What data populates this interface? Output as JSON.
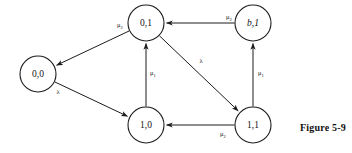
{
  "figure": {
    "caption": "Figure 5-9",
    "caption_x": 300,
    "caption_y": 122,
    "background_color": "#ffffff",
    "stroke_color": "#1c1c1c"
  },
  "diagram": {
    "type": "state-transition-diagram",
    "node_radius": 18,
    "nodes": [
      {
        "id": "n00",
        "label": "0,0",
        "x": 38,
        "y": 74,
        "italic": false
      },
      {
        "id": "n01",
        "label": "0,1",
        "x": 146,
        "y": 23,
        "italic": false
      },
      {
        "id": "nb1",
        "label": "b,1",
        "x": 253,
        "y": 23,
        "italic": true
      },
      {
        "id": "n10",
        "label": "1,0",
        "x": 146,
        "y": 125,
        "italic": false
      },
      {
        "id": "n11",
        "label": "1,1",
        "x": 253,
        "y": 125,
        "italic": false
      }
    ],
    "edges": [
      {
        "id": "e1",
        "from": "n01",
        "to": "n00",
        "label": "μ",
        "sub": "2",
        "label_x": 120,
        "label_y": 26
      },
      {
        "id": "e2",
        "from": "nb1",
        "to": "n01",
        "label": "μ",
        "sub": "2",
        "label_x": 229,
        "label_y": 18
      },
      {
        "id": "e3",
        "from": "n10",
        "to": "n01",
        "label": "μ",
        "sub": "1",
        "label_x": 153,
        "label_y": 74
      },
      {
        "id": "e4",
        "from": "n11",
        "to": "nb1",
        "label": "μ",
        "sub": "1",
        "label_x": 261,
        "label_y": 74
      },
      {
        "id": "e5",
        "from": "n01",
        "to": "n11",
        "label": "λ",
        "sub": "",
        "label_x": 201,
        "label_y": 62
      },
      {
        "id": "e6",
        "from": "n11",
        "to": "n10",
        "label": "μ",
        "sub": "2",
        "label_x": 223,
        "label_y": 135
      },
      {
        "id": "e7",
        "from": "n00",
        "to": "n10",
        "label": "λ",
        "sub": "",
        "label_x": 58,
        "label_y": 93
      }
    ]
  }
}
